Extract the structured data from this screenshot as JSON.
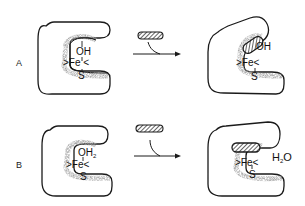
{
  "panels": [
    {
      "label": "A",
      "before": {
        "ligand": "OH",
        "metal": "Fe",
        "bridge": "S"
      },
      "after": {
        "ligand": "OH",
        "metal": "Fe",
        "bridge": "S"
      },
      "substrate": "hatched-substrate"
    },
    {
      "label": "B",
      "before": {
        "ligand": "OH",
        "ligand_sub": "2",
        "metal": "Fe",
        "bridge": "S"
      },
      "after": {
        "metal": "Fe",
        "bridge": "S",
        "released": "H",
        "released_sub": "2",
        "released_tail": "O"
      },
      "substrate": "hatched-substrate"
    }
  ],
  "colors": {
    "line": "#1a1a1a",
    "stipple": "#8a8a8a",
    "hatch": "#222222"
  }
}
